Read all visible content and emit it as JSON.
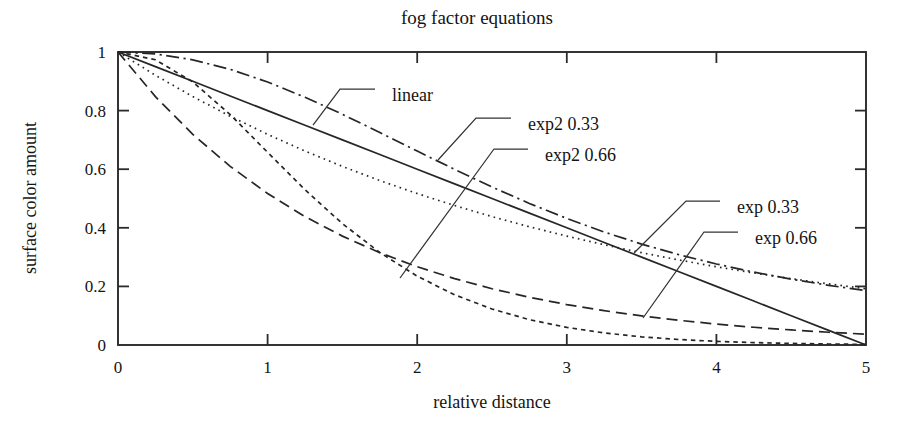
{
  "chart_data": {
    "type": "line",
    "title": "fog factor equations",
    "xlabel": "relative distance",
    "ylabel": "surface color amount",
    "xlim": [
      0,
      5
    ],
    "ylim": [
      0,
      1
    ],
    "grid": false,
    "legend_position": "inline-annotations",
    "xticks": [
      "0",
      "1",
      "2",
      "3",
      "4",
      "5"
    ],
    "xtick_values": [
      0,
      1,
      2,
      3,
      4,
      5
    ],
    "yticks": [
      "0",
      "0.2",
      "0.4",
      "0.6",
      "0.8",
      "1"
    ],
    "ytick_values": [
      0,
      0.2,
      0.4,
      0.6,
      0.8,
      1
    ],
    "x": [
      0,
      0.25,
      0.5,
      0.75,
      1,
      1.25,
      1.5,
      1.75,
      2,
      2.25,
      2.5,
      2.75,
      3,
      3.25,
      3.5,
      3.75,
      4,
      4.25,
      4.5,
      4.75,
      5
    ],
    "series": [
      {
        "name": "linear",
        "label": "linear",
        "style": "solid",
        "values": [
          1,
          0.95,
          0.9,
          0.85,
          0.8,
          0.75,
          0.7,
          0.65,
          0.6,
          0.55,
          0.5,
          0.45,
          0.4,
          0.35,
          0.3,
          0.25,
          0.2,
          0.15,
          0.1,
          0.05,
          0
        ]
      },
      {
        "name": "exp2 0.33",
        "label": "exp2 0.33",
        "style": "dash-dot",
        "values": [
          1,
          0.9933,
          0.9733,
          0.9409,
          0.8977,
          0.8457,
          0.7874,
          0.7254,
          0.6619,
          0.5993,
          0.5392,
          0.4831,
          0.4318,
          0.3855,
          0.3444,
          0.3082,
          0.2765,
          0.2488,
          0.2247,
          0.2037,
          0.1853
        ]
      },
      {
        "name": "exp2 0.66",
        "label": "exp2 0.66",
        "style": "short-dash",
        "values": [
          1,
          0.9736,
          0.8979,
          0.7862,
          0.6577,
          0.5298,
          0.4142,
          0.3156,
          0.2349,
          0.1714,
          0.1228,
          0.0865,
          0.0601,
          0.0412,
          0.0279,
          0.0187,
          0.0124,
          0.0082,
          0.0053,
          0.0034,
          0.0022
        ]
      },
      {
        "name": "exp 0.33",
        "label": "exp 0.33",
        "style": "dotted",
        "values": [
          1,
          0.9208,
          0.8479,
          0.7808,
          0.7189,
          0.662,
          0.6096,
          0.5613,
          0.5169,
          0.476,
          0.4382,
          0.4035,
          0.3716,
          0.3421,
          0.315,
          0.2901,
          0.2671,
          0.2459,
          0.2264,
          0.2085,
          0.192
        ]
      },
      {
        "name": "exp 0.66",
        "label": "exp 0.66",
        "style": "long-dash",
        "values": [
          1,
          0.8479,
          0.7189,
          0.6096,
          0.5169,
          0.4382,
          0.3716,
          0.3151,
          0.2671,
          0.2265,
          0.1921,
          0.1629,
          0.1381,
          0.1171,
          0.0993,
          0.0842,
          0.0714,
          0.0605,
          0.0513,
          0.0435,
          0.0369
        ]
      }
    ],
    "annotations": [
      {
        "name": "linear",
        "text": "linear",
        "x": 2.35,
        "y": 0.865
      },
      {
        "name": "exp2 0.33",
        "text": "exp2 0.33",
        "x": 3.46,
        "y": 0.745
      },
      {
        "name": "exp2 0.66",
        "text": "exp2 0.66",
        "x": 3.63,
        "y": 0.625
      },
      {
        "name": "exp 0.33",
        "text": "exp 0.33",
        "x": 6.05,
        "y": 0.465
      },
      {
        "name": "exp 0.66",
        "text": "exp 0.66",
        "x": 6.3,
        "y": 0.375
      }
    ]
  }
}
